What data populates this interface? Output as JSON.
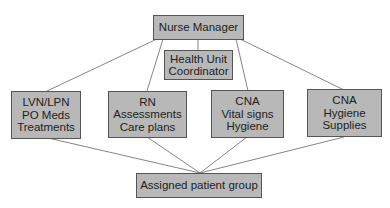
{
  "diagram": {
    "manager": {
      "label": "Nurse Manager"
    },
    "coordinator": {
      "lines": [
        "Health Unit",
        "Coordinator"
      ]
    },
    "staff": [
      {
        "lines": [
          "LVN/LPN",
          "PO Meds",
          "Treatments"
        ]
      },
      {
        "lines": [
          "RN",
          "Assessments",
          "Care plans"
        ]
      },
      {
        "lines": [
          "CNA",
          "Vital signs",
          "Hygiene"
        ]
      },
      {
        "lines": [
          "CNA",
          "Hygiene",
          "Supplies"
        ]
      }
    ],
    "patients": {
      "label": "Assigned patient group"
    },
    "colors": {
      "box_fill": "#b8b8b8",
      "border": "#555555",
      "line": "#555555"
    }
  }
}
